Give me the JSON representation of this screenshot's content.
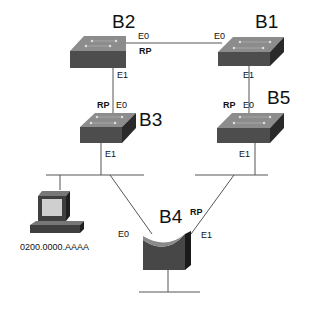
{
  "diagram": {
    "type": "spanning-tree-bridged-network",
    "colors": {
      "switch_top": "#8a8a8a",
      "switch_front": "#4a4a4a",
      "switch_side": "#2a2a2a",
      "line": "#555555",
      "text": "#111111"
    },
    "bridges": [
      {
        "id": "B1",
        "label": "B1",
        "icon": "switch-icon",
        "ports": [
          {
            "label": "E0",
            "rp": false
          },
          {
            "label": "E1",
            "rp": false
          }
        ]
      },
      {
        "id": "B2",
        "label": "B2",
        "icon": "switch-icon",
        "ports": [
          {
            "label": "E0",
            "rp": true
          },
          {
            "label": "E1",
            "rp": false
          }
        ]
      },
      {
        "id": "B3",
        "label": "B3",
        "icon": "switch-icon",
        "ports": [
          {
            "label": "E0",
            "rp": true
          },
          {
            "label": "E1",
            "rp": false
          }
        ]
      },
      {
        "id": "B4",
        "label": "B4",
        "icon": "router-bridge-icon",
        "ports": [
          {
            "label": "E0",
            "rp": false
          },
          {
            "label": "E1",
            "rp": true
          }
        ]
      },
      {
        "id": "B5",
        "label": "B5",
        "icon": "switch-icon",
        "ports": [
          {
            "label": "E0",
            "rp": true
          },
          {
            "label": "E1",
            "rp": false
          }
        ]
      }
    ],
    "labels": {
      "b2": "B2",
      "b1": "B1",
      "b3": "B3",
      "b5": "B5",
      "b4": "B4",
      "b2_e0": "E0",
      "b2_rp": "RP",
      "b2_e1": "E1",
      "b1_e0": "E0",
      "b1_e1": "E1",
      "b3_rp": "RP",
      "b3_e0": "E0",
      "b3_e1": "E1",
      "b5_rp": "RP",
      "b5_e0": "E0",
      "b5_e1": "E1",
      "b4_e0": "E0",
      "b4_e1": "E1",
      "b4_rp": "RP"
    },
    "host": {
      "label": "0200.0000.AAAA",
      "icon": "workstation-icon"
    },
    "links": [
      {
        "from": "B2.E0",
        "to": "B1.E0"
      },
      {
        "from": "B2.E1",
        "to": "B3.E0"
      },
      {
        "from": "B1.E1",
        "to": "B5.E0"
      },
      {
        "from": "B3.E1",
        "to": "left-lan-segment"
      },
      {
        "from": "B5.E1",
        "to": "right-lan-segment"
      },
      {
        "from": "left-lan-segment",
        "to": "B4.E0"
      },
      {
        "from": "right-lan-segment",
        "to": "B4.E1"
      },
      {
        "from": "host",
        "to": "left-lan-segment"
      },
      {
        "from": "B4",
        "to": "bottom-lan-segment"
      }
    ]
  }
}
